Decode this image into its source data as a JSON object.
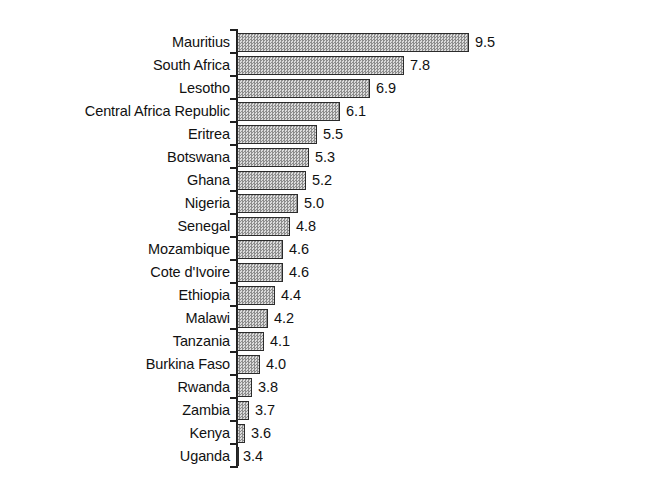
{
  "chart_data": {
    "type": "bar",
    "orientation": "horizontal",
    "title": "",
    "subtitle": "",
    "xlabel": "",
    "ylabel": "",
    "grid": false,
    "legend": null,
    "xlim": [
      0,
      9.5
    ],
    "axis_origin_value": 0,
    "categories": [
      "Mauritius",
      "South Africa",
      "Lesotho",
      "Central Africa Republic",
      "Eritrea",
      "Botswana",
      "Ghana",
      "Nigeria",
      "Senegal",
      "Mozambique",
      "Cote d'Ivoire",
      "Ethiopia",
      "Malawi",
      "Tanzania",
      "Burkina Faso",
      "Rwanda",
      "Zambia",
      "Kenya",
      "Uganda"
    ],
    "values": [
      9.5,
      7.8,
      6.9,
      6.1,
      5.5,
      5.3,
      5.2,
      5.0,
      4.8,
      4.6,
      4.6,
      4.4,
      4.2,
      4.1,
      4.0,
      3.8,
      3.7,
      3.6,
      3.4
    ],
    "value_labels": [
      "9.5",
      "7.8",
      "6.9",
      "6.1",
      "5.5",
      "5.3",
      "5.2",
      "5.0",
      "4.8",
      "4.6",
      "4.6",
      "4.4",
      "4.2",
      "4.1",
      "4.0",
      "3.8",
      "3.7",
      "3.6",
      "3.4"
    ],
    "bar_fill_color": "#c2c2c2",
    "bar_edge_color": "#2b2b2b",
    "axis_color": "#202020",
    "background_color": "#ffffff"
  },
  "layout": {
    "axis_x_px": 237,
    "bar_zero_x_px": 108,
    "px_per_unit": 38.0,
    "row_top_px": 31,
    "row_pitch_px": 23,
    "bar_height_px": 19,
    "label_gap_px": 6
  }
}
